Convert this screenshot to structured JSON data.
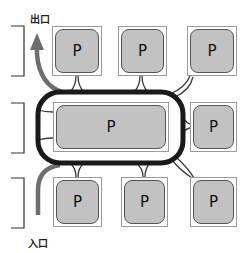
{
  "diagram": {
    "exit_label": "出口",
    "entrance_label": "入口",
    "colors": {
      "loop_road": "#1a1a1a",
      "access_path": "#6e6e6e",
      "parking_fill": "#c2c2c2",
      "connector": "#3a3a3a"
    },
    "rows": [
      {
        "name": "top-row",
        "spaces": [
          {
            "label": "P"
          },
          {
            "label": "P"
          },
          {
            "label": "P"
          }
        ]
      },
      {
        "name": "middle-row",
        "spaces": [
          {
            "label": "P"
          },
          {
            "label": "P"
          }
        ]
      },
      {
        "name": "bottom-row",
        "spaces": [
          {
            "label": "P"
          },
          {
            "label": "P"
          },
          {
            "label": "P"
          }
        ]
      }
    ],
    "brackets": 3
  }
}
